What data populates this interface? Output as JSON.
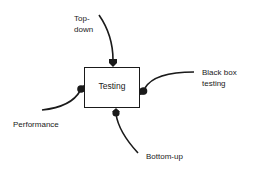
{
  "diagram": {
    "center": {
      "label": "Testing"
    },
    "inputs": [
      {
        "id": "top-down",
        "line1": "Top-",
        "line2": "down",
        "side": "top"
      },
      {
        "id": "black-box",
        "line1": "Black box",
        "line2": "testing",
        "side": "right"
      },
      {
        "id": "performance",
        "line1": "Performance",
        "side": "left"
      },
      {
        "id": "bottom-up",
        "line1": "Bottom-up",
        "side": "bottom"
      }
    ],
    "colors": {
      "stroke": "#1a1a1a",
      "background": "#ffffff"
    }
  }
}
